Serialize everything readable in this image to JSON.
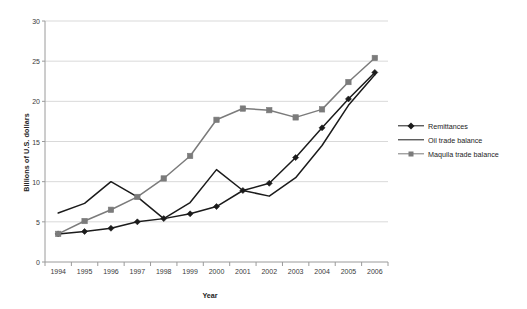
{
  "chart_data": {
    "type": "line",
    "title": "",
    "xlabel": "Year",
    "ylabel": "Billions of U.S. dollars",
    "categories": [
      "1994",
      "1995",
      "1996",
      "1997",
      "1998",
      "1999",
      "2000",
      "2001",
      "2002",
      "2003",
      "2004",
      "2005",
      "2006"
    ],
    "x": [
      1994,
      1995,
      1996,
      1997,
      1998,
      1999,
      2000,
      2001,
      2002,
      2003,
      2004,
      2005,
      2006
    ],
    "ylim": [
      0,
      30
    ],
    "yticks": [
      0,
      5,
      10,
      15,
      20,
      25,
      30
    ],
    "grid": true,
    "legend_position": "right",
    "series": [
      {
        "name": "Remittances",
        "color": "#1b1b1b",
        "marker": "diamond",
        "values": [
          3.5,
          3.8,
          4.2,
          5.0,
          5.4,
          6.0,
          6.9,
          8.9,
          9.8,
          13.0,
          16.7,
          20.3,
          23.6
        ]
      },
      {
        "name": "Oil trade balance",
        "color": "#1b1b1b",
        "marker": "none",
        "values": [
          6.1,
          7.3,
          10.0,
          8.1,
          5.4,
          7.4,
          11.5,
          8.9,
          8.2,
          10.5,
          14.5,
          19.5,
          23.3
        ]
      },
      {
        "name": "Maquila trade balance",
        "color": "#7b7b7b",
        "marker": "square",
        "values": [
          3.5,
          5.1,
          6.5,
          8.1,
          10.4,
          13.2,
          17.7,
          19.1,
          18.9,
          18.0,
          19.0,
          22.4,
          25.4
        ]
      }
    ]
  },
  "axis": {
    "y_tick_labels": [
      "0",
      "5",
      "10",
      "15",
      "20",
      "25",
      "30"
    ],
    "x_tick_labels": [
      "1994",
      "1995",
      "1996",
      "1997",
      "1998",
      "1999",
      "2000",
      "2001",
      "2002",
      "2003",
      "2004",
      "2005",
      "2006"
    ],
    "y_title": "Billions of U.S. dollars",
    "x_title": "Year"
  },
  "legend": {
    "items": [
      {
        "label": "Remittances",
        "color": "#1b1b1b",
        "marker": "diamond"
      },
      {
        "label": "Oil trade balance",
        "color": "#1b1b1b",
        "marker": "none"
      },
      {
        "label": "Maquila trade balance",
        "color": "#7b7b7b",
        "marker": "square"
      }
    ]
  },
  "colors": {
    "grid": "#d9d9d9",
    "axis": "#9a9a9a",
    "series_dark": "#1b1b1b",
    "series_gray": "#7b7b7b",
    "background": "#ffffff"
  }
}
